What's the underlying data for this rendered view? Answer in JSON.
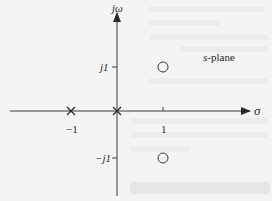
{
  "diagram": {
    "title_label": "s-plane",
    "axes": {
      "real_axis_label": "σ",
      "imag_axis_label": "jω",
      "real_ticks": [
        {
          "label": "−1",
          "value": -1
        },
        {
          "label": "1",
          "value": 1
        }
      ],
      "imag_ticks": [
        {
          "label": "j1",
          "value": 1
        },
        {
          "label": "−j1",
          "value": -1
        }
      ]
    },
    "poles": [
      {
        "marker": "x",
        "real": -1,
        "imag": 0
      },
      {
        "marker": "x",
        "real": 0,
        "imag": 0
      }
    ],
    "zeros": [
      {
        "marker": "o",
        "real": 1,
        "imag": 1
      },
      {
        "marker": "o",
        "real": 1,
        "imag": -1
      }
    ],
    "colors": {
      "background": "#f4f4f2",
      "ink": "#2a2a2a"
    }
  }
}
